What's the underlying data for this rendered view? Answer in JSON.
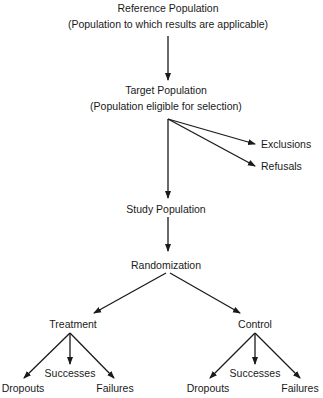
{
  "diagram": {
    "reference": {
      "title": "Reference Population",
      "subtitle": "(Population to which results are applicable)"
    },
    "target": {
      "title": "Target Population",
      "subtitle": "(Population eligible for selection)"
    },
    "side_branches": [
      "Exclusions",
      "Refusals"
    ],
    "study": "Study Population",
    "randomization": "Randomization",
    "arms": [
      {
        "label": "Treatment",
        "outcomes": [
          "Dropouts",
          "Successes",
          "Failures"
        ]
      },
      {
        "label": "Control",
        "outcomes": [
          "Dropouts",
          "Successes",
          "Failures"
        ]
      }
    ],
    "line_color": "#1a1a1a"
  }
}
